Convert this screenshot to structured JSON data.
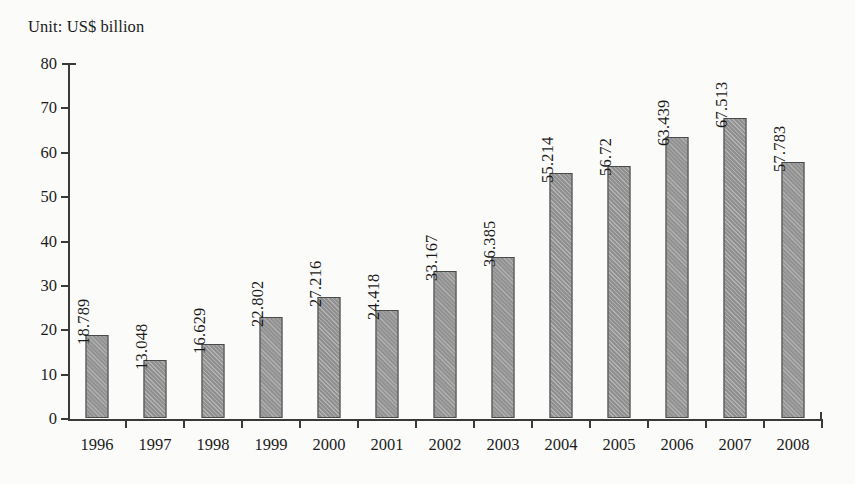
{
  "chart_data": {
    "type": "bar",
    "title": "Unit: US$ billion",
    "xlabel": "",
    "ylabel": "",
    "ylim": [
      0,
      80
    ],
    "ytick_step": 10,
    "grid": false,
    "legend": "none",
    "bar_color": "#909090",
    "bar_border_color": "#4a4a4a",
    "categories": [
      "1996",
      "1997",
      "1998",
      "1999",
      "2000",
      "2001",
      "2002",
      "2003",
      "2004",
      "2005",
      "2006",
      "2007",
      "2008"
    ],
    "values": [
      18.789,
      13.048,
      16.629,
      22.802,
      27.216,
      24.418,
      33.167,
      36.385,
      55.214,
      56.72,
      63.439,
      67.513,
      57.783
    ],
    "value_labels": [
      "18.789",
      "13.048",
      "16.629",
      "22.802",
      "27.216",
      "24.418",
      "33.167",
      "36.385",
      "55.214",
      "56.72",
      "63.439",
      "67.513",
      "57.783"
    ],
    "ytick_labels": [
      "80",
      "70",
      "60",
      "50",
      "40",
      "30",
      "20",
      "10",
      "0"
    ],
    "ytick_values": [
      80,
      70,
      60,
      50,
      40,
      30,
      20,
      10,
      0
    ]
  }
}
